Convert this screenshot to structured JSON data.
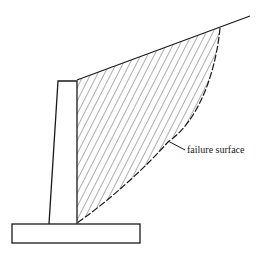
{
  "diagram": {
    "annotation": {
      "label": "failure surface"
    },
    "colors": {
      "stroke": "#1a1a1a",
      "hatch": "#333333",
      "text": "#222222",
      "background": "#ffffff"
    },
    "elements": [
      "retaining-wall-stem",
      "footing-base",
      "ground-surface-slope",
      "soil-wedge-hatched",
      "failure-surface-curve"
    ]
  }
}
